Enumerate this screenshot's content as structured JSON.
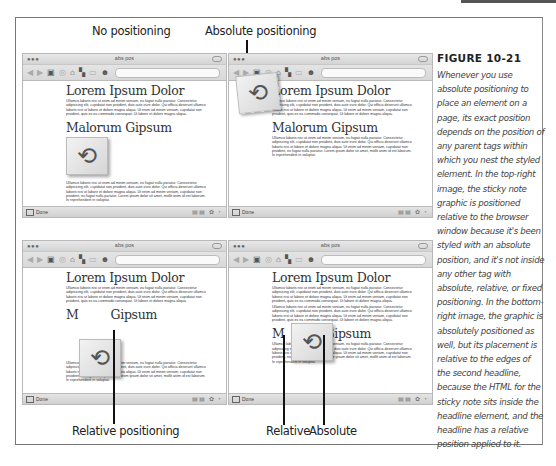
{
  "figure": {
    "number": "FIGURE 10-21",
    "caption": "Whenever you use absolute positioning to place an element on a page, its exact position depends on the position of any parent tags within which you nest the styled element. In the top-right image, the sticky note graphic is positioned relative to the browser window because it's been styled with an absolute position, and it's not inside any other tag with absolute, relative, or fixed positioning. In the bottom-right image, the graphic is absolutely positioned as well, but its placement is relative to the edges of the second headline, because the HTML for the sticky note sits inside the headline element, and the headline has a relative position applied to it."
  },
  "labels": {
    "top_left": "No positioning",
    "top_right": "Absolute positioning",
    "bottom_left": "Relative positioning",
    "bottom_right_relative": "Relative",
    "bottom_right_absolute": "Absolute"
  },
  "browser": {
    "window_title": "abs pos",
    "traffic_lights": "●●●",
    "status": "Done",
    "status_icons": "▤▤ ✿ ◔",
    "toolbar_icons": [
      "◀",
      "▶",
      "▣",
      "◎",
      "⌂",
      "▚",
      "▭",
      "☻",
      "▾",
      "○",
      "↻"
    ]
  },
  "page": {
    "heading1": "Lorem Ipsum Dolor",
    "heading2": "Malorum Gipsum",
    "heading2_split_left": "M",
    "heading2_split_right": "Gipsum",
    "para1": "Ullamco laboris nisi ut enim ad minim veniam, eu fugiat nulla pariatur. Consectetur adipisicing elit, cupidatat non proident, duis aute irure dolor. Qui officia deserunt ullamco laboris nisi ut labore et dolore magna aliqua. Ut enim ad minim veniam, cupidatat non proident, quis ex ea commodo consequat. Ut labore et dolore magna aliqua.",
    "para2": "Ullamco laboris nisi ut enim ad minim veniam, eu fugiat nulla pariatur. Consectetur adipisicing elit, cupidatat non proident, duis aute irure dolor. Qui officia deserunt ullamco laboris nisi ut labore et dolore magna aliqua. Ut enim ad minim veniam, cupidatat non proident, eu fugiat nulla pariatur. Lorem ipsum dolor sit amet, mollit anim id est laborum. In reprehenderit in voluptat.",
    "sticky_note_glyph": "⟲"
  }
}
